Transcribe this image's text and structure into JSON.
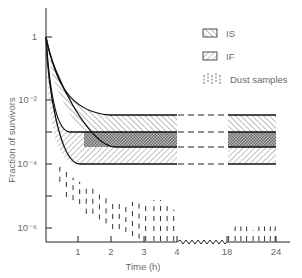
{
  "chart_data": {
    "type": "area",
    "title": "",
    "xlabel": "Time (h)",
    "ylabel": "Fraction of survivors",
    "yscale": "log",
    "ylim": [
      3e-07,
      30
    ],
    "y_ticks": [
      {
        "value": 1,
        "label": "1"
      },
      {
        "value": 0.01,
        "label": "10⁻²"
      },
      {
        "value": 0.001,
        "label": ""
      },
      {
        "value": 0.0001,
        "label": "10⁻⁴"
      },
      {
        "value": 1e-05,
        "label": ""
      },
      {
        "value": 1e-06,
        "label": "10⁻⁶"
      }
    ],
    "x_ticks": [
      {
        "value": 1,
        "label": "1"
      },
      {
        "value": 2,
        "label": "2"
      },
      {
        "value": 3,
        "label": "3"
      },
      {
        "value": 4,
        "label": "4"
      },
      {
        "value": 18,
        "label": "18"
      },
      {
        "value": 24,
        "label": "24"
      }
    ],
    "x_axis_break": {
      "from": 4,
      "to": 18
    },
    "grid": false,
    "legend_position": "upper right",
    "legend": [
      {
        "label": "IS",
        "pattern": "hatch-backslash"
      },
      {
        "label": "IF",
        "pattern": "hatch-slash"
      },
      {
        "label": "Dust samples",
        "pattern": "dashed-vertical"
      }
    ],
    "series": [
      {
        "name": "IS",
        "kind": "band",
        "upper_plateau": 0.0035,
        "lower_plateau": 0.00035,
        "start": 1
      },
      {
        "name": "IF",
        "kind": "band",
        "upper_plateau": 0.001,
        "lower_plateau": 0.0001,
        "start": 1
      },
      {
        "name": "Dust samples",
        "kind": "scatter-range",
        "points": [
          {
            "t": 0.45,
            "lo": 3e-05,
            "hi": 0.0001
          },
          {
            "t": 0.65,
            "lo": 1e-05,
            "hi": 7e-05
          },
          {
            "t": 0.85,
            "lo": 8e-06,
            "hi": 4e-05
          },
          {
            "t": 1.05,
            "lo": 6e-06,
            "hi": 3e-05
          },
          {
            "t": 1.25,
            "lo": 3e-06,
            "hi": 2e-05
          },
          {
            "t": 1.45,
            "lo": 3e-06,
            "hi": 2e-05
          },
          {
            "t": 1.65,
            "lo": 2e-06,
            "hi": 1.2e-05
          },
          {
            "t": 1.85,
            "lo": 1.5e-06,
            "hi": 1.2e-05
          },
          {
            "t": 2.05,
            "lo": 1e-06,
            "hi": 8e-06
          },
          {
            "t": 2.25,
            "lo": 1e-06,
            "hi": 8e-06
          },
          {
            "t": 2.45,
            "lo": 8e-07,
            "hi": 7e-06
          },
          {
            "t": 2.65,
            "lo": 6e-07,
            "hi": 7e-06
          },
          {
            "t": 2.85,
            "lo": 5e-07,
            "hi": 7e-06
          },
          {
            "t": 3.05,
            "lo": 4e-07,
            "hi": 6e-06
          },
          {
            "t": 3.3,
            "lo": 4e-07,
            "hi": 8e-06
          },
          {
            "t": 3.5,
            "lo": 4e-07,
            "hi": 8e-06
          },
          {
            "t": 3.7,
            "lo": 4e-07,
            "hi": 6e-06
          },
          {
            "t": 3.9,
            "lo": 4e-07,
            "hi": 4e-06
          },
          {
            "t": 18.2,
            "lo": 4e-07,
            "hi": 8e-07
          },
          {
            "t": 19.0,
            "lo": 4e-07,
            "hi": 1.2e-06
          },
          {
            "t": 19.7,
            "lo": 4e-07,
            "hi": 1.2e-06
          },
          {
            "t": 20.4,
            "lo": 4e-07,
            "hi": 1.2e-06
          },
          {
            "t": 21.2,
            "lo": 4e-07,
            "hi": 9e-07
          },
          {
            "t": 21.9,
            "lo": 4e-07,
            "hi": 1.2e-06
          },
          {
            "t": 22.6,
            "lo": 4e-07,
            "hi": 1.2e-06
          },
          {
            "t": 23.3,
            "lo": 4e-07,
            "hi": 1.2e-06
          },
          {
            "t": 23.9,
            "lo": 4e-07,
            "hi": 1.2e-06
          }
        ]
      }
    ]
  },
  "labels": {
    "xlabel": "Time (h)",
    "ylabel": "Fraction of survivors",
    "legend_is": "IS",
    "legend_if": "IF",
    "legend_dust": "Dust samples"
  }
}
